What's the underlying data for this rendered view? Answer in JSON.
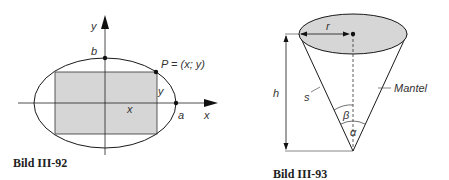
{
  "figure1": {
    "caption": "Bild III-92",
    "labels": {
      "y_axis": "y",
      "x_axis": "x",
      "b": "b",
      "a": "a",
      "point": "P = (x; y)",
      "x_dim": "x",
      "y_dim": "y"
    }
  },
  "figure2": {
    "caption": "Bild III-93",
    "labels": {
      "r": "r",
      "h": "h",
      "s": "s",
      "mantel": "Mantel",
      "beta": "β",
      "alpha": "α"
    }
  },
  "colors": {
    "fill": "#d6d6d6",
    "stroke": "#1a1a1a"
  }
}
